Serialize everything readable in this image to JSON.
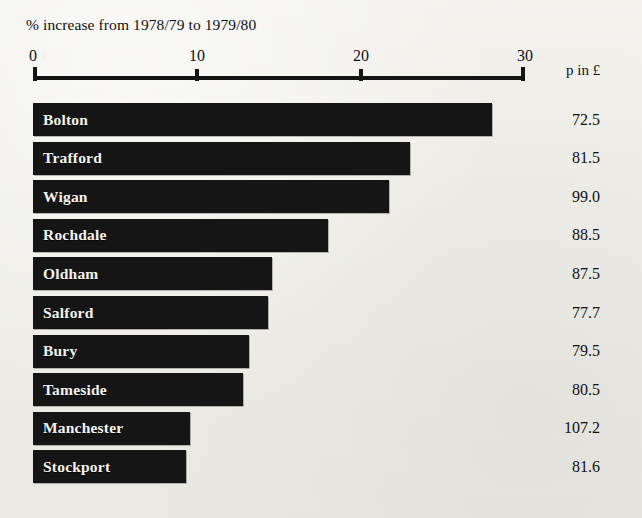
{
  "chart_data": {
    "type": "bar",
    "orientation": "horizontal",
    "title": "% increase from 1978/79 to 1979/80",
    "xlabel": "",
    "ylabel": "",
    "xlim": [
      0,
      30
    ],
    "xticks": [
      0,
      10,
      20,
      30
    ],
    "xtick_labels": [
      "0",
      "10",
      "20",
      "30"
    ],
    "grid": false,
    "legend": null,
    "value_column_header": "p in £",
    "categories": [
      "Bolton",
      "Trafford",
      "Wigan",
      "Rochdale",
      "Oldham",
      "Salford",
      "Bury",
      "Tameside",
      "Manchester",
      "Stockport"
    ],
    "values": [
      28.0,
      23.0,
      21.7,
      18.0,
      14.6,
      14.3,
      13.2,
      12.8,
      9.6,
      9.3
    ],
    "series": [
      {
        "name": "% increase from 1978/79 to 1979/80",
        "values": [
          28.0,
          23.0,
          21.7,
          18.0,
          14.6,
          14.3,
          13.2,
          12.8,
          9.6,
          9.3
        ]
      },
      {
        "name": "p in £",
        "values": [
          72.5,
          81.5,
          99.0,
          88.5,
          87.5,
          77.7,
          79.5,
          80.5,
          107.2,
          81.6
        ]
      }
    ],
    "rows": [
      {
        "label": "Bolton",
        "percent_increase": 28.0,
        "p_in_pound": "72.5"
      },
      {
        "label": "Trafford",
        "percent_increase": 23.0,
        "p_in_pound": "81.5"
      },
      {
        "label": "Wigan",
        "percent_increase": 21.7,
        "p_in_pound": "99.0"
      },
      {
        "label": "Rochdale",
        "percent_increase": 18.0,
        "p_in_pound": "88.5"
      },
      {
        "label": "Oldham",
        "percent_increase": 14.6,
        "p_in_pound": "87.5"
      },
      {
        "label": "Salford",
        "percent_increase": 14.3,
        "p_in_pound": "77.7"
      },
      {
        "label": "Bury",
        "percent_increase": 13.2,
        "p_in_pound": "79.5"
      },
      {
        "label": "Tameside",
        "percent_increase": 12.8,
        "p_in_pound": "80.5"
      },
      {
        "label": "Manchester",
        "percent_increase": 9.6,
        "p_in_pound": "107.2"
      },
      {
        "label": "Stockport",
        "percent_increase": 9.3,
        "p_in_pound": "81.6"
      }
    ],
    "colors": {
      "bar": "#151515",
      "bar_label_text": "#f4f3ef",
      "background": "#efeeea",
      "axis": "#141414",
      "text": "#111111"
    }
  }
}
